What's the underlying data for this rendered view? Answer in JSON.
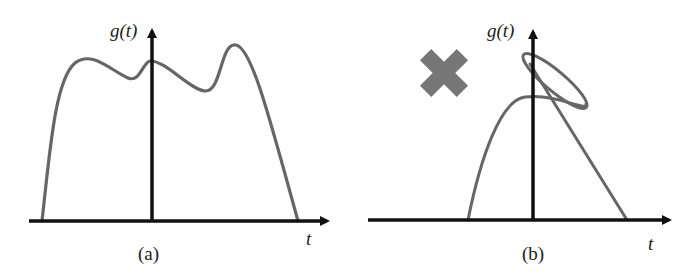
{
  "figure": {
    "panels": [
      {
        "id": "a",
        "caption": "(a)",
        "y_axis_label": "g(t)",
        "x_axis_label": "t",
        "description": "Valid function: single-valued curve with two maxima and dips"
      },
      {
        "id": "b",
        "caption": "(b)",
        "y_axis_label": "g(t)",
        "x_axis_label": "t",
        "marker": "cross-mark",
        "description": "Invalid function: curve loops back on itself (multi-valued)"
      }
    ],
    "colors": {
      "axis": "#111111",
      "curve": "#666666",
      "cross": "#777777"
    }
  }
}
